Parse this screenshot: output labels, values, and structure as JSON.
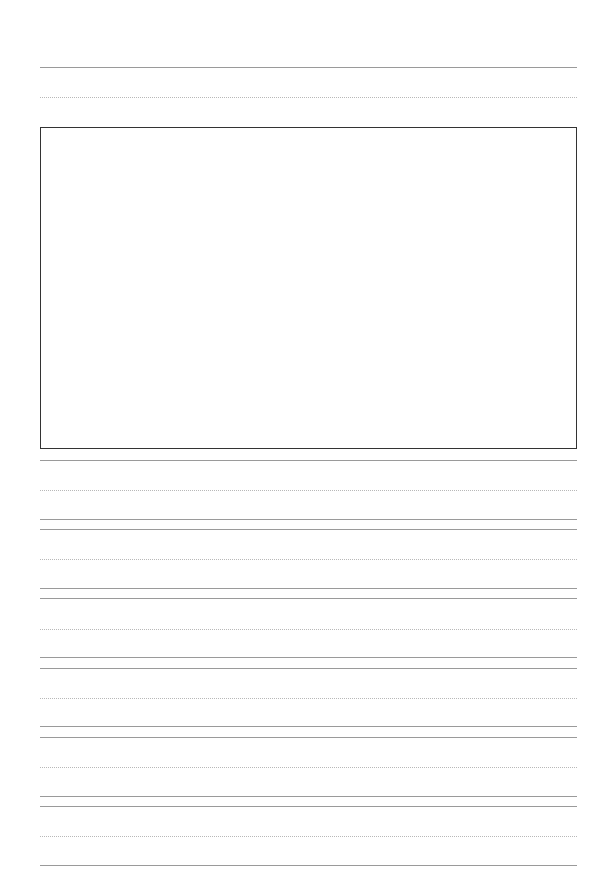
{
  "document": {
    "type": "handwriting practice paper with drawing box",
    "page_size_px": [
      607,
      895
    ],
    "colors": {
      "background": "#ffffff",
      "box_border": "#333333",
      "solid_line": "#9a9a9a",
      "dotted_line": "#b8b8b8"
    },
    "header_writing_row": {
      "top_line_y": 67,
      "mid_dotted_y": 97
    },
    "drawing_box": {
      "x": 40,
      "y": 127,
      "width": 537,
      "height": 322,
      "content": ""
    },
    "writing_rows": [
      {
        "top_y": 460,
        "mid_dotted_y": 490,
        "base_y": 519
      },
      {
        "top_y": 529,
        "mid_dotted_y": 559,
        "base_y": 588
      },
      {
        "top_y": 598,
        "mid_dotted_y": 629,
        "base_y": 657
      },
      {
        "top_y": 668,
        "mid_dotted_y": 698,
        "base_y": 726
      },
      {
        "top_y": 737,
        "mid_dotted_y": 767,
        "base_y": 796
      },
      {
        "top_y": 806,
        "mid_dotted_y": 836,
        "base_y": 865
      }
    ]
  }
}
